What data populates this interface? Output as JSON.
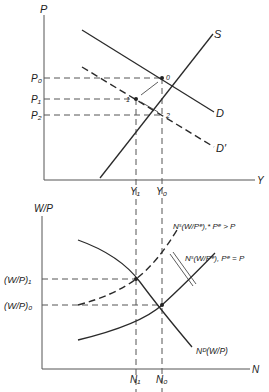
{
  "top_panel": {
    "y_axis_label": "P",
    "x_axis_label": "Y",
    "price_labels": [
      "P₀",
      "P₁",
      "P₂"
    ],
    "output_labels": [
      "Y₁",
      "Y₀"
    ],
    "curves": {
      "supply": "S",
      "demand": "D",
      "demand_shifted": "D′"
    },
    "points": [
      "0",
      "1",
      "2"
    ]
  },
  "bottom_panel": {
    "y_axis_label": "W/P",
    "x_axis_label": "N",
    "wage_labels": [
      "(W/P)₁",
      "(W/P)₀"
    ],
    "employment_labels": [
      "N₁",
      "N₀"
    ],
    "curves": {
      "labor_supply_expected_high": "Nˢ(W/Pᵉ),* Pᵉ > P",
      "labor_supply": "Nˢ(W/Pᵉ), Pᵉ = P",
      "labor_demand": "Nᴰ(W/P)"
    }
  },
  "colors": {
    "line": "#2a2a2a",
    "dashed": "#555555",
    "background": "#ffffff"
  }
}
